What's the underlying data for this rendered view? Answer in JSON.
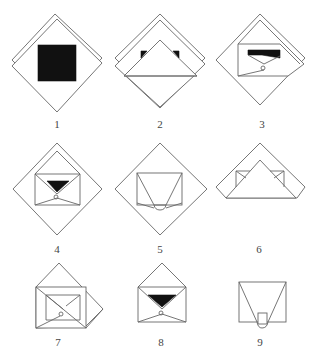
{
  "diagram": {
    "title": "",
    "type": "folding-steps",
    "colors": {
      "line": "#666666",
      "fill_dark": "#111111",
      "background": "#ffffff"
    },
    "steps": [
      {
        "label": "1",
        "desc": "diamond sheet (double layer) with black square"
      },
      {
        "label": "2",
        "desc": "bottom corner folded up to form triangle, black corners visible"
      },
      {
        "label": "3",
        "desc": "side folded in, black band and small flap"
      },
      {
        "label": "4",
        "desc": "envelope shape with black triangle inside diamond"
      },
      {
        "label": "5",
        "desc": "trapezoid folds inside diamond"
      },
      {
        "label": "6",
        "desc": "triangle with small side pockets"
      },
      {
        "label": "7",
        "desc": "rotated envelope with diagonal flap"
      },
      {
        "label": "8",
        "desc": "open envelope with black triangle"
      },
      {
        "label": "9",
        "desc": "final trapezoid with tab"
      }
    ]
  }
}
